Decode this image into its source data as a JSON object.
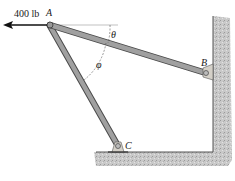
{
  "diagram": {
    "force": {
      "label": "400 lb",
      "direction": "left"
    },
    "points": {
      "A": {
        "label": "A"
      },
      "B": {
        "label": "B"
      },
      "C": {
        "label": "C"
      }
    },
    "angles": {
      "theta": {
        "label": "θ"
      },
      "phi": {
        "label": "φ"
      }
    },
    "members": [
      "AB",
      "AC"
    ],
    "colors": {
      "rod_fill": "#9a9a9a",
      "rod_edge": "#4a4a4a",
      "wall": "#c8c8c8",
      "wall_edge": "#555555",
      "support": "#d4d0c8",
      "text": "#1a1a1a"
    }
  }
}
